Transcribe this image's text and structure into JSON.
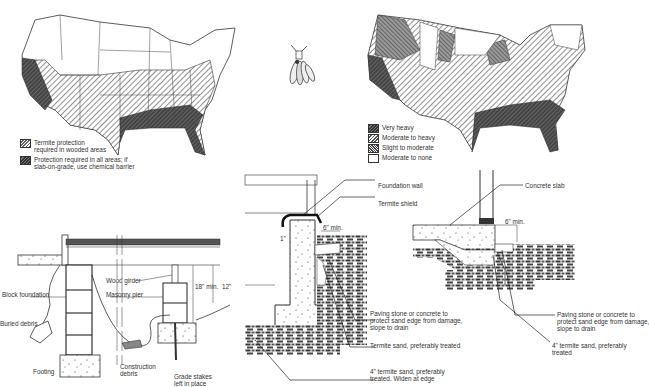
{
  "map_left": {
    "title": "Termite protection requirements map",
    "legend": [
      {
        "pattern": "light-hatch",
        "label_line1": "Termite protection",
        "label_line2": "required in wooded areas"
      },
      {
        "pattern": "dark-hatch",
        "label_line1": "Protection required in all areas; if",
        "label_line2": "slab-on-grade, use chemical barrier"
      }
    ]
  },
  "termite_illustration": {
    "icon": "winged-termite-icon"
  },
  "map_right": {
    "title": "Termite infestation severity map",
    "legend": [
      {
        "pattern": "dark-hatch",
        "label": "Very heavy"
      },
      {
        "pattern": "medium-hatch",
        "label": "Moderate to heavy"
      },
      {
        "pattern": "cross-hatch",
        "label": "Slight to moderate"
      },
      {
        "pattern": "none",
        "label": "Moderate to none"
      }
    ]
  },
  "crawlspace_diagram": {
    "labels": {
      "block_foundation": "Block foundation",
      "buried_debris": "Buried debris",
      "footing": "Footing",
      "wood_girder": "Wood girder",
      "masonry_pier": "Masonry pier",
      "construction_debris_1": "Construction",
      "construction_debris_2": "debris",
      "grade_stakes_1": "Grade stakes",
      "grade_stakes_2": "left in place",
      "clearance_min": "18\" min.",
      "clearance_12": "12\""
    }
  },
  "foundation_wall_diagram": {
    "labels": {
      "foundation_wall": "Foundation wall",
      "termite_shield": "Termite shield",
      "min_6": "6\" min.",
      "one_inch": "1\"",
      "paving_1": "Paving stone or concrete to",
      "paving_2": "protect sand edge from damage,",
      "paving_3": "slope to drain",
      "termite_sand": "Termite sand, preferably treated",
      "sand_4in_1": "4\" termite sand, preferably",
      "sand_4in_2": "treated. Widen at edge"
    }
  },
  "slab_diagram": {
    "labels": {
      "concrete_slab": "Concrete slab",
      "min_6": "6\" min.",
      "paving_1": "Paving stone or concrete to",
      "paving_2": "protect sand edge from damage,",
      "paving_3": "slope to drain",
      "sand_4in_1": "4\" termite sand, preferably",
      "sand_4in_2": "treated"
    }
  }
}
